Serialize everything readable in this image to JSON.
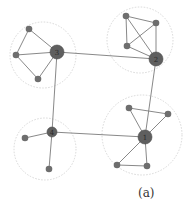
{
  "figure": {
    "caption": "(a)",
    "colors": {
      "node": "#6e6e6e",
      "hub": "#5f5f5f",
      "edge": "#7a7a7a",
      "cluster_circle": "#d8d8d8",
      "label": "#2a2a2a"
    },
    "hubs": [
      {
        "id": "1",
        "label": "1",
        "x": 145,
        "y": 137,
        "r": 7
      },
      {
        "id": "2",
        "label": "2",
        "x": 156,
        "y": 59,
        "r": 7
      },
      {
        "id": "3",
        "label": "3",
        "x": 57,
        "y": 52,
        "r": 7
      },
      {
        "id": "4",
        "label": "4",
        "x": 52,
        "y": 132,
        "r": 5
      }
    ],
    "leaves": [
      {
        "id": "3a",
        "x": 29,
        "y": 29
      },
      {
        "id": "3b",
        "x": 16,
        "y": 55
      },
      {
        "id": "3c",
        "x": 38,
        "y": 79
      },
      {
        "id": "2a",
        "x": 126,
        "y": 16
      },
      {
        "id": "2b",
        "x": 156,
        "y": 23
      },
      {
        "id": "2c",
        "x": 127,
        "y": 46
      },
      {
        "id": "4a",
        "x": 25,
        "y": 138
      },
      {
        "id": "4b",
        "x": 49,
        "y": 169
      },
      {
        "id": "1a",
        "x": 129,
        "y": 108
      },
      {
        "id": "1b",
        "x": 168,
        "y": 114
      },
      {
        "id": "1c",
        "x": 117,
        "y": 165
      },
      {
        "id": "1d",
        "x": 147,
        "y": 166
      }
    ],
    "clusters": [
      {
        "id": "c3",
        "x": 43,
        "y": 55,
        "r": 33
      },
      {
        "id": "c2",
        "x": 140,
        "y": 40,
        "r": 33
      },
      {
        "id": "c4",
        "x": 45,
        "y": 149,
        "r": 31
      },
      {
        "id": "c1",
        "x": 142,
        "y": 135,
        "r": 40
      }
    ],
    "edges": [
      [
        "3",
        "2"
      ],
      [
        "3",
        "4"
      ],
      [
        "4",
        "1"
      ],
      [
        "2",
        "1"
      ],
      [
        "3",
        "3a"
      ],
      [
        "3",
        "3b"
      ],
      [
        "3a",
        "3b"
      ],
      [
        "3b",
        "3c"
      ],
      [
        "3",
        "3c"
      ],
      [
        "2",
        "2a"
      ],
      [
        "2",
        "2b"
      ],
      [
        "2",
        "2c"
      ],
      [
        "2a",
        "2c"
      ],
      [
        "2b",
        "2c"
      ],
      [
        "2a",
        "2b"
      ],
      [
        "4",
        "4a"
      ],
      [
        "4",
        "4b"
      ],
      [
        "1",
        "1a"
      ],
      [
        "1",
        "1b"
      ],
      [
        "1a",
        "1b"
      ],
      [
        "1",
        "1c"
      ],
      [
        "1",
        "1d"
      ],
      [
        "1c",
        "1d"
      ]
    ]
  }
}
